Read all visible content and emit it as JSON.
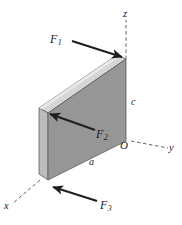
{
  "figure": {
    "background_color": "#ffffff",
    "ink_color": "#1a1a1a",
    "slab": {
      "front_face_color": "#969696",
      "top_face_color": "#d3d3d3",
      "side_face_color": "#b8b8b8",
      "edge_color": "#555555"
    },
    "axes": [
      {
        "id": "z",
        "label": "z",
        "style": "dashed",
        "direction": "up"
      },
      {
        "id": "y",
        "label": "y",
        "style": "dashed",
        "direction": "right-down"
      },
      {
        "id": "x",
        "label": "x",
        "style": "dashed",
        "direction": "left-down"
      }
    ],
    "origin": {
      "label": "O"
    },
    "dimensions": [
      {
        "id": "c",
        "label": "c",
        "edge": "vertical-right"
      },
      {
        "id": "a",
        "label": "a",
        "edge": "bottom-front"
      }
    ],
    "forces": [
      {
        "id": "F1",
        "symbol": "F",
        "subscript": "1",
        "label": "F1",
        "direction": "right-down",
        "applied_at": "top-right-corner"
      },
      {
        "id": "F2",
        "symbol": "F",
        "subscript": "2",
        "label": "F2",
        "direction": "left-up",
        "applied_at": "left-edge-mid"
      },
      {
        "id": "F3",
        "symbol": "F",
        "subscript": "3",
        "label": "F3",
        "direction": "left-up",
        "applied_at": "bottom-left-corner"
      }
    ]
  }
}
